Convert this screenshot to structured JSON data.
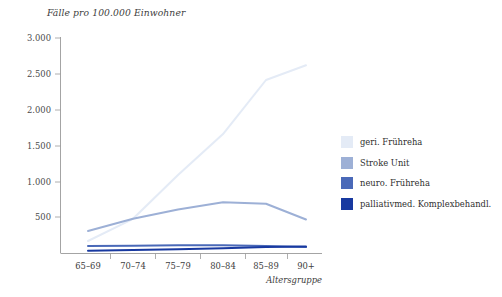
{
  "chart_data": {
    "type": "line",
    "title": "Fälle pro 100.000 Einwohner",
    "xlabel": "Altersgruppe",
    "ylabel": "",
    "categories": [
      "65–69",
      "70–74",
      "75–79",
      "80–84",
      "85–89",
      "90+"
    ],
    "ylim": [
      0,
      3000
    ],
    "ytick_labels": [
      "3.000",
      "2.500",
      "2.000",
      "1.500",
      "1.000",
      "500"
    ],
    "ytick_values": [
      3000,
      2500,
      2000,
      1500,
      1000,
      500
    ],
    "grid": false,
    "legend_position": "right",
    "series": [
      {
        "name": "geri. Frühreha",
        "color": "#e4ebf6",
        "values": [
          170,
          480,
          1090,
          1660,
          2415,
          2620
        ]
      },
      {
        "name": "Stroke Unit",
        "color": "#9db0d6",
        "values": [
          310,
          480,
          610,
          710,
          690,
          470
        ]
      },
      {
        "name": "neuro. Frühreha",
        "color": "#4a69b8",
        "values": [
          100,
          105,
          110,
          110,
          100,
          85
        ]
      },
      {
        "name": "palliativmed. Komplexbehandl.",
        "color": "#1839a0",
        "values": [
          35,
          45,
          55,
          70,
          85,
          95
        ]
      }
    ]
  },
  "legend": {
    "items": [
      {
        "label": "geri. Frühreha"
      },
      {
        "label": "Stroke Unit"
      },
      {
        "label": "neuro. Frühreha"
      },
      {
        "label": "palliativmed. Komplexbehandl."
      }
    ]
  },
  "axes": {
    "x_ticks": [
      "65–69",
      "70–74",
      "75–79",
      "80–84",
      "85–89",
      "90+"
    ],
    "y_ticks": [
      "3.000",
      "2.500",
      "2.000",
      "1.500",
      "1.000",
      "500"
    ],
    "x_title": "Altersgruppe"
  }
}
